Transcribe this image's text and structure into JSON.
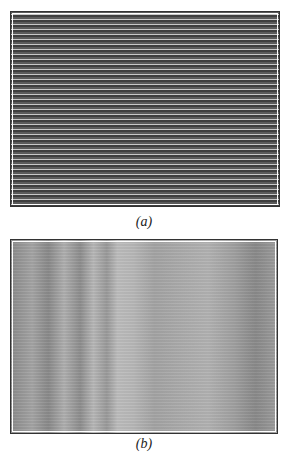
{
  "figure": {
    "panels": [
      {
        "id": "a",
        "caption": "(a)",
        "description": "fine horizontal fringe pattern (dark background, light lines)"
      },
      {
        "id": "b",
        "caption": "(b)",
        "description": "grey fringe pattern with diagonal bands"
      }
    ]
  }
}
